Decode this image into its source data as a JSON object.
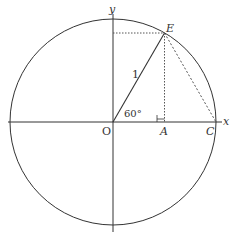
{
  "diagram": {
    "type": "unit-circle",
    "labels": {
      "x_axis": "x",
      "y_axis": "y",
      "origin": "O",
      "point_e": "E",
      "point_a": "A",
      "point_c": "C",
      "radius": "1",
      "angle": "60°"
    },
    "geometry": {
      "center": [
        113,
        122
      ],
      "radius_px": 103,
      "angle_deg": 60
    },
    "colors": {
      "stroke": "#333333",
      "dotted": "#555555"
    }
  }
}
